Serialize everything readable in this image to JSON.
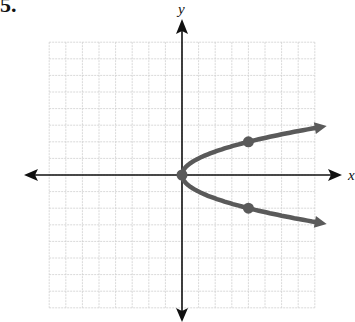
{
  "problem_number": "5.",
  "chart_data": {
    "type": "line",
    "title": "",
    "xlabel": "x",
    "ylabel": "y",
    "xlim": [
      -8,
      8
    ],
    "ylim": [
      -8,
      8
    ],
    "grid": true,
    "equation": "x = y^2",
    "series": [
      {
        "name": "upper branch",
        "x": [
          0,
          1,
          4,
          9
        ],
        "y": [
          0,
          1,
          2,
          3
        ]
      },
      {
        "name": "lower branch",
        "x": [
          0,
          1,
          4,
          9
        ],
        "y": [
          0,
          -1,
          -2,
          -3
        ]
      }
    ],
    "marked_points": [
      [
        0,
        0
      ],
      [
        4,
        2
      ],
      [
        4,
        -2
      ]
    ],
    "colors": {
      "curve": "#5a5a5a",
      "grid": "#cfcfcf",
      "axis": "#111111"
    }
  }
}
